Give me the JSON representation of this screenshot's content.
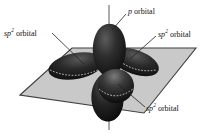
{
  "figure": {
    "name": "sp2-hybrid-orbital-diagram",
    "background_color": "#ffffff",
    "plane_color": "#c9c9c9",
    "plane_edge_color": "#3a3a3a",
    "orbital_color": "#1a1a1a",
    "orbital_highlight_color": "#6e6e6e",
    "axis_color": "#8a8a8a",
    "leader_line_color": "#222222"
  },
  "labels": {
    "p_orbital": {
      "italic": "p",
      "rest": " orbital"
    },
    "sp2_orbital_left": {
      "italic": "sp",
      "sup": "2",
      "rest": " orbital"
    },
    "sp2_orbital_right": {
      "italic": "sp",
      "sup": "2",
      "rest": " orbital"
    },
    "sp2_orbital_front": {
      "italic": "sp",
      "sup": "2",
      "rest": " orbital"
    }
  },
  "geometry": {
    "plane_vertices": "20,95 72,48 196,48 144,113",
    "vertical_axis": {
      "x": 109,
      "y_top": 5,
      "y_bottom": 130
    },
    "lobes": [
      {
        "name": "p-orbital-upper-lobe",
        "direction": "up"
      },
      {
        "name": "p-orbital-lower-lobe",
        "direction": "down"
      },
      {
        "name": "sp2-lobe-left",
        "direction": "left-back"
      },
      {
        "name": "sp2-lobe-right",
        "direction": "right-back"
      },
      {
        "name": "sp2-lobe-front",
        "direction": "front-down"
      }
    ]
  }
}
